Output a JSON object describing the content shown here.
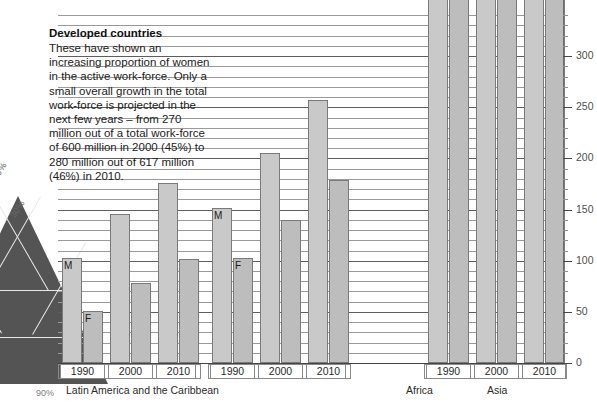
{
  "intro": {
    "title": "Developed countries",
    "body": "These have shown an increasing proportion of women in the active work-force. Only a small overall growth in the total work-force is projected in the next few years – from 270 million out of a total work-force of 600 million in 2000 (45%) to 280 million out of 617 million (46%) in 2010."
  },
  "ternary": {
    "label_30": "30%",
    "label_90": "90%"
  },
  "series_tags": {
    "male": "M",
    "female": "F"
  },
  "chart_data": {
    "type": "bar",
    "title": "Developed countries",
    "xlabel": "",
    "ylabel": "",
    "ylim": [
      0,
      340
    ],
    "yticks": [
      0,
      50,
      100,
      150,
      200,
      250,
      300
    ],
    "ytick_labels": [
      "0",
      "50",
      "100",
      "150",
      "200",
      "250",
      "300"
    ],
    "minor_tick_step": 10,
    "grid": true,
    "legend": "inline-bar-tags",
    "unit": "millions",
    "groups": [
      {
        "region": "Latin America  and the Caribbean",
        "years": [
          {
            "year": "1990",
            "male": 103,
            "female": 51,
            "tag_male": "M",
            "tag_female": "F"
          },
          {
            "year": "2000",
            "male": 146,
            "female": 78,
            "tag_male": "",
            "tag_female": ""
          },
          {
            "year": "2010",
            "male": 176,
            "female": 102,
            "tag_male": "",
            "tag_female": ""
          }
        ]
      },
      {
        "region": "Africa",
        "years": [
          {
            "year": "1990",
            "male": 152,
            "female": 103,
            "tag_male": "M",
            "tag_female": "F"
          },
          {
            "year": "2000",
            "male": 205,
            "female": 140,
            "tag_male": "",
            "tag_female": ""
          },
          {
            "year": "2010",
            "male": 257,
            "female": 179,
            "tag_male": "",
            "tag_female": ""
          }
        ]
      },
      {
        "region": "Asia",
        "years": [
          {
            "year": "1990",
            "male": 400,
            "female": 400,
            "tag_male": "",
            "tag_female": "",
            "clipped": true
          },
          {
            "year": "2000",
            "male": 400,
            "female": 400,
            "tag_male": "",
            "tag_female": "",
            "clipped": true
          },
          {
            "year": "2010",
            "male": 400,
            "female": 400,
            "tag_male": "",
            "tag_female": "",
            "clipped": true
          }
        ]
      }
    ]
  },
  "colors": {
    "bar_male": "#c9c9c9",
    "bar_female": "#bdbdbd",
    "bar_stroke": "#7a7a7a",
    "grid_minor": "#9a9a9a",
    "grid_major": "#5e5e5e",
    "ternary_fill": "#545454",
    "background": "#ffffff"
  }
}
